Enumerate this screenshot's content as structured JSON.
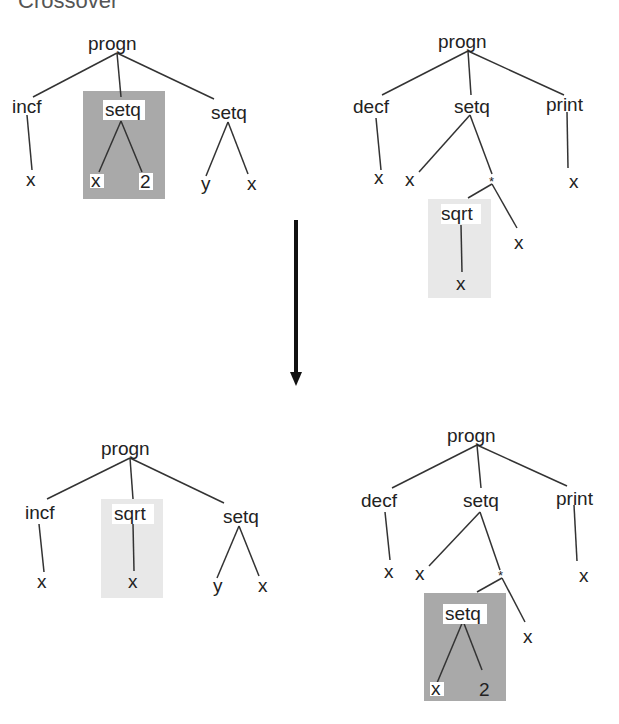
{
  "title": "Crossover",
  "colors": {
    "dark_highlight": "#a9a9a9",
    "light_highlight": "#e8e8e8",
    "line": "#333333",
    "arrow": "#111111"
  },
  "trees": {
    "top_left": {
      "root": "progn",
      "children": [
        "incf",
        "setq",
        "setq"
      ],
      "incf_child": "x",
      "highlight": {
        "node": "setq",
        "children": [
          "x",
          "2"
        ]
      },
      "setq_children": [
        "y",
        "x"
      ]
    },
    "top_right": {
      "root": "progn",
      "children": [
        "decf",
        "setq",
        "print"
      ],
      "decf_child": "x",
      "setq_children": [
        "x",
        "*"
      ],
      "star_children": [
        "sqrt",
        "x"
      ],
      "highlight": {
        "node": "sqrt",
        "children": [
          "x"
        ]
      },
      "print_child": "x"
    },
    "bottom_left": {
      "root": "progn",
      "children": [
        "incf",
        "sqrt",
        "setq"
      ],
      "incf_child": "x",
      "highlight": {
        "node": "sqrt",
        "children": [
          "x"
        ]
      },
      "setq_children": [
        "y",
        "x"
      ]
    },
    "bottom_right": {
      "root": "progn",
      "children": [
        "decf",
        "setq",
        "print"
      ],
      "decf_child": "x",
      "setq_children": [
        "x",
        "*"
      ],
      "star_children": [
        "setq",
        "x"
      ],
      "highlight": {
        "node": "setq",
        "children": [
          "x",
          "2"
        ]
      },
      "print_child": "x"
    }
  }
}
